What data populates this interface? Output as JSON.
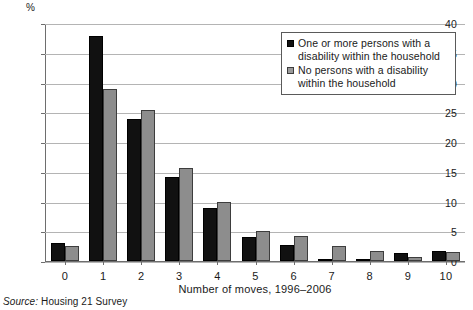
{
  "chart": {
    "type": "bar",
    "y_unit_label": "%",
    "xlabel": "Number of moves, 1996–2006",
    "ylabel": "",
    "title": "",
    "ylim": [
      0,
      40
    ],
    "ytick_labels": [
      "0",
      "5",
      "10",
      "15",
      "20",
      "25",
      "30",
      "35",
      "40"
    ],
    "grid": "horizontal",
    "legend_position": "top-right"
  },
  "chart_data": {
    "type": "bar",
    "title": "",
    "xlabel": "Number of moves, 1996–2006",
    "ylabel": "%",
    "ylim": [
      0,
      40
    ],
    "yticks": [
      0,
      5,
      10,
      15,
      20,
      25,
      30,
      35,
      40
    ],
    "categories": [
      "0",
      "1",
      "2",
      "3",
      "4",
      "5",
      "6",
      "7",
      "8",
      "9",
      "10"
    ],
    "series": [
      {
        "name": "One or more persons with a disability within the household",
        "color": "#111111",
        "values": [
          3.0,
          37.8,
          23.9,
          14.2,
          8.9,
          4.1,
          2.7,
          0.3,
          0.3,
          1.3,
          1.6
        ]
      },
      {
        "name": "No persons with a disability within the household",
        "color": "#8d8d8d",
        "values": [
          2.5,
          28.9,
          25.4,
          15.6,
          9.9,
          5.0,
          4.2,
          2.6,
          1.7,
          0.7,
          1.5
        ]
      }
    ],
    "legend": [
      "One or more persons with a disability within the household",
      "No persons with a disability within the household"
    ],
    "legend_position": "top-right",
    "grid": true
  },
  "legend": {
    "items": [
      {
        "line1": "One or more persons with a",
        "line2": "disability within the household"
      },
      {
        "line1": "No persons with a disability",
        "line2": "within the household"
      }
    ]
  },
  "source": {
    "label": "Source:",
    "text": "Housing 21 Survey"
  }
}
